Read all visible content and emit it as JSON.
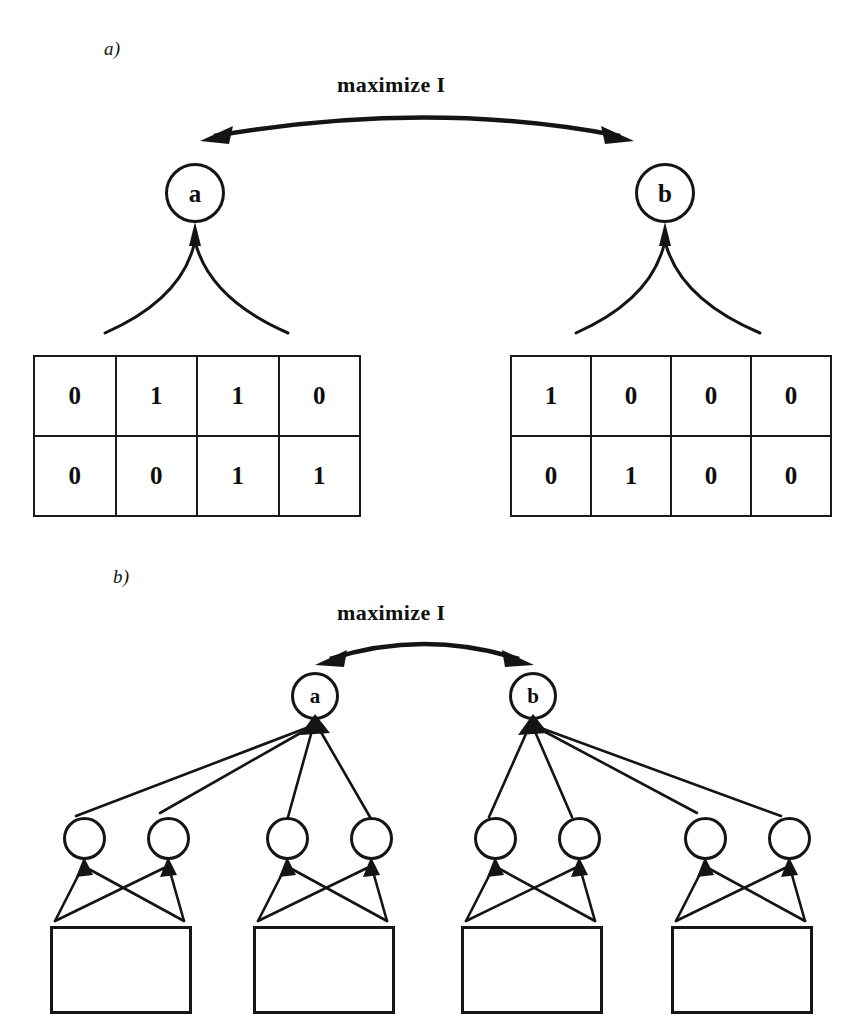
{
  "figure": {
    "panels": [
      {
        "id": "a",
        "label": "a)",
        "objective_label": "maximize I",
        "nodes": [
          {
            "id": "node-a",
            "label": "a"
          },
          {
            "id": "node-b",
            "label": "b"
          }
        ],
        "tables": [
          {
            "id": "bit-table-left",
            "rows": [
              [
                "0",
                "1",
                "1",
                "0"
              ],
              [
                "0",
                "0",
                "1",
                "1"
              ]
            ]
          },
          {
            "id": "bit-table-right",
            "rows": [
              [
                "1",
                "0",
                "0",
                "0"
              ],
              [
                "0",
                "1",
                "0",
                "0"
              ]
            ]
          }
        ]
      },
      {
        "id": "b",
        "label": "b)",
        "objective_label": "maximize I",
        "nodes": [
          {
            "id": "node-a",
            "label": "a"
          },
          {
            "id": "node-b",
            "label": "b"
          }
        ],
        "hidden_units": [
          "",
          "",
          "",
          "",
          "",
          "",
          "",
          ""
        ],
        "input_blocks": [
          "",
          "",
          "",
          ""
        ]
      }
    ]
  },
  "style": {
    "ink": "#141414",
    "paper": "#ffffff"
  }
}
